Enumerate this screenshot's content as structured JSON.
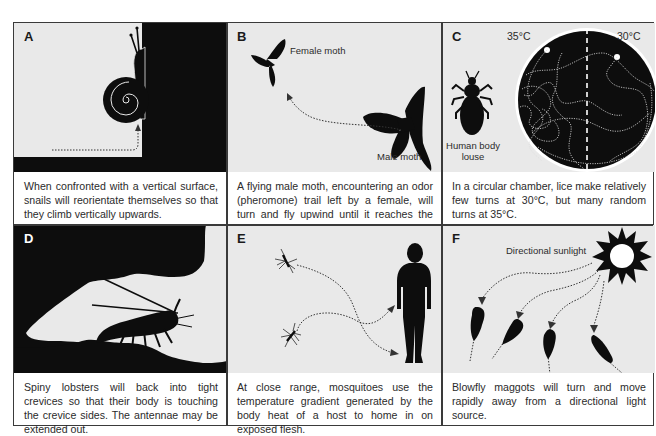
{
  "figure": {
    "panels": [
      {
        "id": "A",
        "letter": "A",
        "subject": "snail",
        "caption": "When confronted with a vertical surface, snails will reorientate themselves so that they climb vertically upwards.",
        "labels": []
      },
      {
        "id": "B",
        "letter": "B",
        "subject": "moth",
        "caption": "A flying male moth, encountering an odor (pheromone) trail left by a female, will turn and fly upwind until it reaches the female.",
        "labels": [
          "Female moth",
          "Male moth"
        ]
      },
      {
        "id": "C",
        "letter": "C",
        "subject": "louse",
        "caption": "In a circular chamber, lice make relatively few turns at 30°C, but many random turns at 35°C.",
        "labels": [
          "35°C",
          "30°C",
          "Human body louse"
        ]
      },
      {
        "id": "D",
        "letter": "D",
        "subject": "spiny-lobster",
        "caption": "Spiny lobsters will back into tight crevices so that their body is touching the crevice sides. The antennae may be extended out.",
        "labels": []
      },
      {
        "id": "E",
        "letter": "E",
        "subject": "mosquito",
        "caption": "At close range, mosquitoes use the temperature gradient generated by the body heat of a host to home in on exposed flesh.",
        "labels": []
      },
      {
        "id": "F",
        "letter": "F",
        "subject": "blowfly-maggot",
        "caption": "Blowfly maggots will turn and move rapidly away from a directional light source.",
        "labels": [
          "Directional sunlight"
        ]
      }
    ],
    "colors": {
      "background": "#e9e9e9",
      "silhouette": "#0d0d0d",
      "border": "#3a3a3a",
      "text": "#2b2b2b"
    }
  }
}
